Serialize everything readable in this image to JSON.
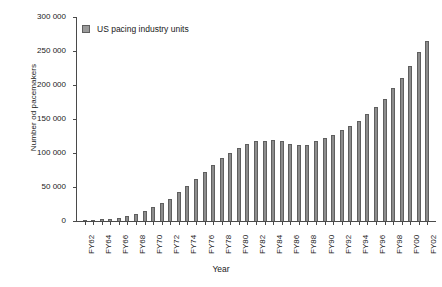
{
  "chart_data": {
    "type": "bar",
    "title": "",
    "xlabel": "Year",
    "ylabel": "Number od pacemakers",
    "ylim": [
      0,
      300000
    ],
    "ytick_labels": [
      "300 000",
      "250 000",
      "200 000",
      "150 000",
      "100 000",
      "50 000",
      "0"
    ],
    "ytick_values": [
      300000,
      250000,
      200000,
      150000,
      100000,
      50000,
      0
    ],
    "grid": false,
    "legend_position": "top-left",
    "legend": [
      "US pacing industry units"
    ],
    "series_color": "#8c8c8c",
    "series_edge_color": "#5f5f5f",
    "categories": [
      "FY62",
      "FY63",
      "FY64",
      "FY65",
      "FY66",
      "FY67",
      "FY68",
      "FY69",
      "FY70",
      "FY71",
      "FY72",
      "FY73",
      "FY74",
      "FY75",
      "FY76",
      "FY77",
      "FY78",
      "FY79",
      "FY80",
      "FY81",
      "FY82",
      "FY83",
      "FY84",
      "FY85",
      "FY86",
      "FY87",
      "FY88",
      "FY89",
      "FY90",
      "FY91",
      "FY92",
      "FY93",
      "FY94",
      "FY95",
      "FY96",
      "FY97",
      "FY98",
      "FY99",
      "FY00",
      "FY01",
      "FY02"
    ],
    "xtick_labels_shown": [
      "FY62",
      "FY64",
      "FY66",
      "FY68",
      "FY70",
      "FY72",
      "FY74",
      "FY76",
      "FY78",
      "FY80",
      "FY82",
      "FY84",
      "FY86",
      "FY88",
      "FY90",
      "FY92",
      "FY94",
      "FY96",
      "FY98",
      "FY00",
      "FY02"
    ],
    "values": [
      1000,
      1500,
      2500,
      3500,
      5000,
      7000,
      10000,
      14000,
      20000,
      26000,
      33000,
      42000,
      52000,
      62000,
      72000,
      82000,
      92000,
      100000,
      108000,
      113000,
      117000,
      117000,
      119000,
      118000,
      113000,
      112000,
      112000,
      117000,
      122000,
      127000,
      134000,
      140000,
      147000,
      157000,
      167000,
      180000,
      195000,
      210000,
      228000,
      248000,
      265000
    ],
    "series": [
      {
        "name": "US pacing industry units",
        "values": [
          1000,
          1500,
          2500,
          3500,
          5000,
          7000,
          10000,
          14000,
          20000,
          26000,
          33000,
          42000,
          52000,
          62000,
          72000,
          82000,
          92000,
          100000,
          108000,
          113000,
          117000,
          117000,
          119000,
          118000,
          113000,
          112000,
          112000,
          117000,
          122000,
          127000,
          134000,
          140000,
          147000,
          157000,
          167000,
          180000,
          195000,
          210000,
          228000,
          248000,
          265000
        ]
      }
    ]
  }
}
